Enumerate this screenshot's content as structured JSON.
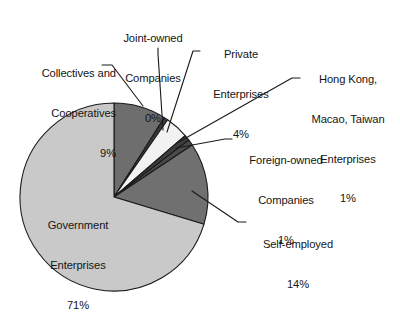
{
  "chart_data": {
    "type": "pie",
    "title": "",
    "subtitle": "",
    "xlabel": "",
    "ylabel": "",
    "legend_position": "none",
    "grid": false,
    "value_suffix": "%",
    "categories": [
      "Collectives and Cooperatives",
      "Joint-owned Companies",
      "Private Enterprises",
      "Hong Kong, Macao, Taiwan Enterprises",
      "Foreign-owned Companies",
      "Self-employed",
      "Government Enterprises"
    ],
    "values": [
      9,
      0,
      4,
      1,
      1,
      14,
      71
    ],
    "colors": [
      "#6e6e6e",
      "#3a3a3a",
      "#f2f2f2",
      "#3d3d3d",
      "#4a4a4a",
      "#707070",
      "#c9c9c9"
    ],
    "start_angle_deg": 0,
    "direction": "clockwise",
    "slices": [
      {
        "name": "Collectives and Cooperatives",
        "value": 9,
        "label": "9%",
        "color": "#6e6e6e"
      },
      {
        "name": "Joint-owned Companies",
        "value": 0,
        "label": "0%",
        "color": "#3a3a3a"
      },
      {
        "name": "Private Enterprises",
        "value": 4,
        "label": "4%",
        "color": "#f2f2f2"
      },
      {
        "name": "Hong Kong, Macao, Taiwan Enterprises",
        "value": 1,
        "label": "1%",
        "color": "#3d3d3d"
      },
      {
        "name": "Foreign-owned Companies",
        "value": 1,
        "label": "1%",
        "color": "#4a4a4a"
      },
      {
        "name": "Self-employed",
        "value": 14,
        "label": "14%",
        "color": "#707070"
      },
      {
        "name": "Government Enterprises",
        "value": 71,
        "label": "71%",
        "color": "#c9c9c9"
      }
    ]
  },
  "labels": {
    "collectives": {
      "line1": "Collectives and",
      "line2": "Cooperatives",
      "line3": "9%"
    },
    "joint_owned": {
      "line1": "Joint-owned",
      "line2": "Companies",
      "line3": "0%"
    },
    "private": {
      "line1": "Private",
      "line2": "Enterprises",
      "line3": "4%"
    },
    "hong_kong": {
      "line1": "Hong Kong,",
      "line2": "Macao, Taiwan",
      "line3": "Enterprises",
      "line4": "1%"
    },
    "foreign": {
      "line1": "Foreign-owned",
      "line2": "Companies",
      "line3": "1%"
    },
    "self_employed": {
      "line1": "Self-employed",
      "line2": "14%"
    },
    "government": {
      "line1": "Government",
      "line2": "Enterprises",
      "line3": "71%"
    }
  },
  "style": {
    "background": "#ffffff",
    "outline": "#1a1a1a",
    "leader_line": "#1a1a1a",
    "text": "#151515"
  }
}
